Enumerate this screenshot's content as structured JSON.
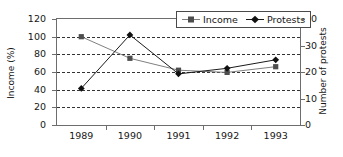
{
  "chart_data": {
    "type": "line",
    "title": "",
    "xlabel": "",
    "categories": [
      "1989",
      "1990",
      "1991",
      "1992",
      "1993"
    ],
    "grid": true,
    "legend_position": "top-right",
    "axes": {
      "left": {
        "label": "Income (%)",
        "ticks": [
          0,
          20,
          40,
          60,
          80,
          100,
          120
        ],
        "tick_labels": [
          "0",
          "20",
          "40",
          "60",
          "80",
          "100",
          "120"
        ],
        "range": [
          0,
          120
        ]
      },
      "right": {
        "label": "Number of protests",
        "ticks": [
          0,
          10,
          20,
          30,
          40
        ],
        "tick_labels": [
          "0",
          "10",
          "20",
          "30",
          "40"
        ],
        "range": [
          0,
          40
        ]
      }
    },
    "series": [
      {
        "name": "Income",
        "axis": "left",
        "marker": "square",
        "color": "#808080",
        "values": [
          100,
          75.5,
          62,
          59.5,
          66
        ]
      },
      {
        "name": "Protests",
        "axis": "right",
        "marker": "diamond",
        "color": "#1a1a1a",
        "values": [
          13.8,
          34.0,
          19.3,
          21.4,
          24.6
        ],
        "values_on_left_scale": [
          41.5,
          102,
          58,
          64.3,
          73.8
        ]
      }
    ]
  },
  "legend": {
    "items": [
      {
        "label": "Income",
        "icon": "square-marker-icon"
      },
      {
        "label": "Protests",
        "icon": "diamond-marker-icon"
      }
    ]
  }
}
